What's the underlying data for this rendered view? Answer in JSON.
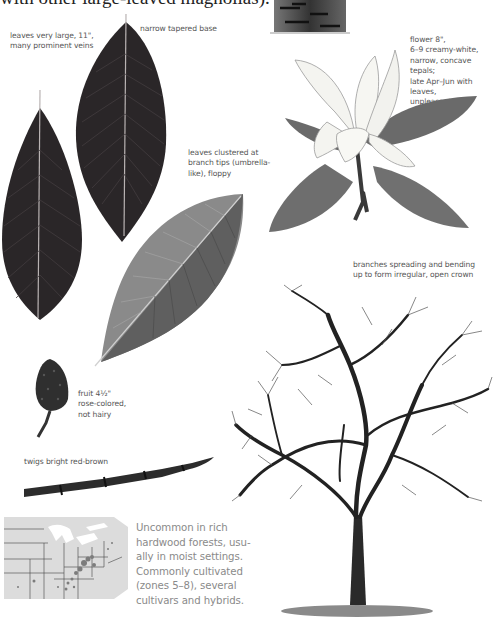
{
  "header": {
    "text_fragment": "with other large-leaved magnolias)."
  },
  "captions": {
    "leaves_size": "leaves very large, 11\", many prominent veins",
    "leaves_size_lines": [
      "leaves very large, 11\",",
      "many prominent veins"
    ],
    "base": "narrow tapered base",
    "clustered_lines": [
      "leaves clustered at",
      "branch tips (umbrella-",
      "like), floppy"
    ],
    "flower_lines": [
      "flower 8\",",
      "6–9 creamy-white,",
      "narrow, concave tepals;",
      "late Apr–Jun with leaves,",
      "unpleasant odor"
    ],
    "crown_lines": [
      "branches spreading and bending",
      "up to form irregular, open crown"
    ],
    "fruit_lines": [
      "fruit 4½\"",
      "rose-colored,",
      "not hairy"
    ],
    "twigs": "twigs bright red-brown"
  },
  "range": {
    "lines": [
      "Uncommon in rich",
      "hardwood forests, usu-",
      "ally in moist settings.",
      "Commonly cultivated",
      "(zones 5–8), several",
      "cultivars and hybrids."
    ]
  },
  "colors": {
    "leaf_dark": "#2a2628",
    "leaf_gray": "#7a7a7a",
    "flower": "#f4f4f0",
    "map_land": "#dcdcdc",
    "map_range": "#7c7c7c",
    "text": "#555555",
    "range_text": "#8a8a8a"
  }
}
